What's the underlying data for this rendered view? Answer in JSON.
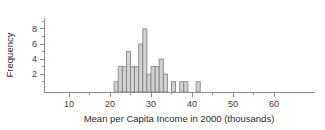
{
  "chart_data": {
    "type": "bar",
    "title": "",
    "subtitle": "",
    "xlabel": "Mean per Capita Income in 2000 (thousands)",
    "ylabel": "Frequency",
    "xlim": [
      6,
      65
    ],
    "ylim": [
      0,
      9
    ],
    "grid": false,
    "legend": null,
    "bin_width": 1,
    "x_major_ticks": [
      10,
      20,
      30,
      40,
      50,
      60
    ],
    "x_minor_ticks": [
      15,
      25,
      35,
      45,
      55
    ],
    "y_major_ticks": [
      2,
      4,
      6,
      8
    ],
    "y_minor_ticks": [
      1,
      3,
      5,
      7
    ],
    "x_tick_labels": [
      "10",
      "20",
      "30",
      "40",
      "50",
      "60"
    ],
    "y_tick_labels": [
      "2",
      "4",
      "6",
      "8"
    ],
    "bins": [
      {
        "left": 21,
        "right": 22,
        "value": 1
      },
      {
        "left": 22,
        "right": 23,
        "value": 3
      },
      {
        "left": 23,
        "right": 24,
        "value": 3
      },
      {
        "left": 24,
        "right": 25,
        "value": 5
      },
      {
        "left": 25,
        "right": 26,
        "value": 3
      },
      {
        "left": 26,
        "right": 27,
        "value": 3
      },
      {
        "left": 27,
        "right": 28,
        "value": 6
      },
      {
        "left": 28,
        "right": 29,
        "value": 8
      },
      {
        "left": 29,
        "right": 30,
        "value": 2
      },
      {
        "left": 30,
        "right": 31,
        "value": 3
      },
      {
        "left": 31,
        "right": 32,
        "value": 3
      },
      {
        "left": 32,
        "right": 33,
        "value": 4
      },
      {
        "left": 33,
        "right": 34,
        "value": 2
      },
      {
        "left": 35,
        "right": 36,
        "value": 1
      },
      {
        "left": 37,
        "right": 38,
        "value": 1
      },
      {
        "left": 38,
        "right": 39,
        "value": 1
      },
      {
        "left": 41,
        "right": 42,
        "value": 1
      }
    ],
    "categories": [
      "21",
      "22",
      "23",
      "24",
      "25",
      "26",
      "27",
      "28",
      "29",
      "30",
      "31",
      "32",
      "33",
      "35",
      "37",
      "38",
      "41"
    ],
    "values": [
      1,
      3,
      3,
      5,
      3,
      3,
      6,
      8,
      2,
      3,
      3,
      4,
      2,
      1,
      1,
      1,
      1
    ],
    "colors": {
      "bar_fill": "#d2d2d2",
      "bar_edge": "#7d7d7d",
      "axis": "#8a8a8a",
      "text": "#2b2b2b",
      "background": "#ffffff"
    }
  }
}
